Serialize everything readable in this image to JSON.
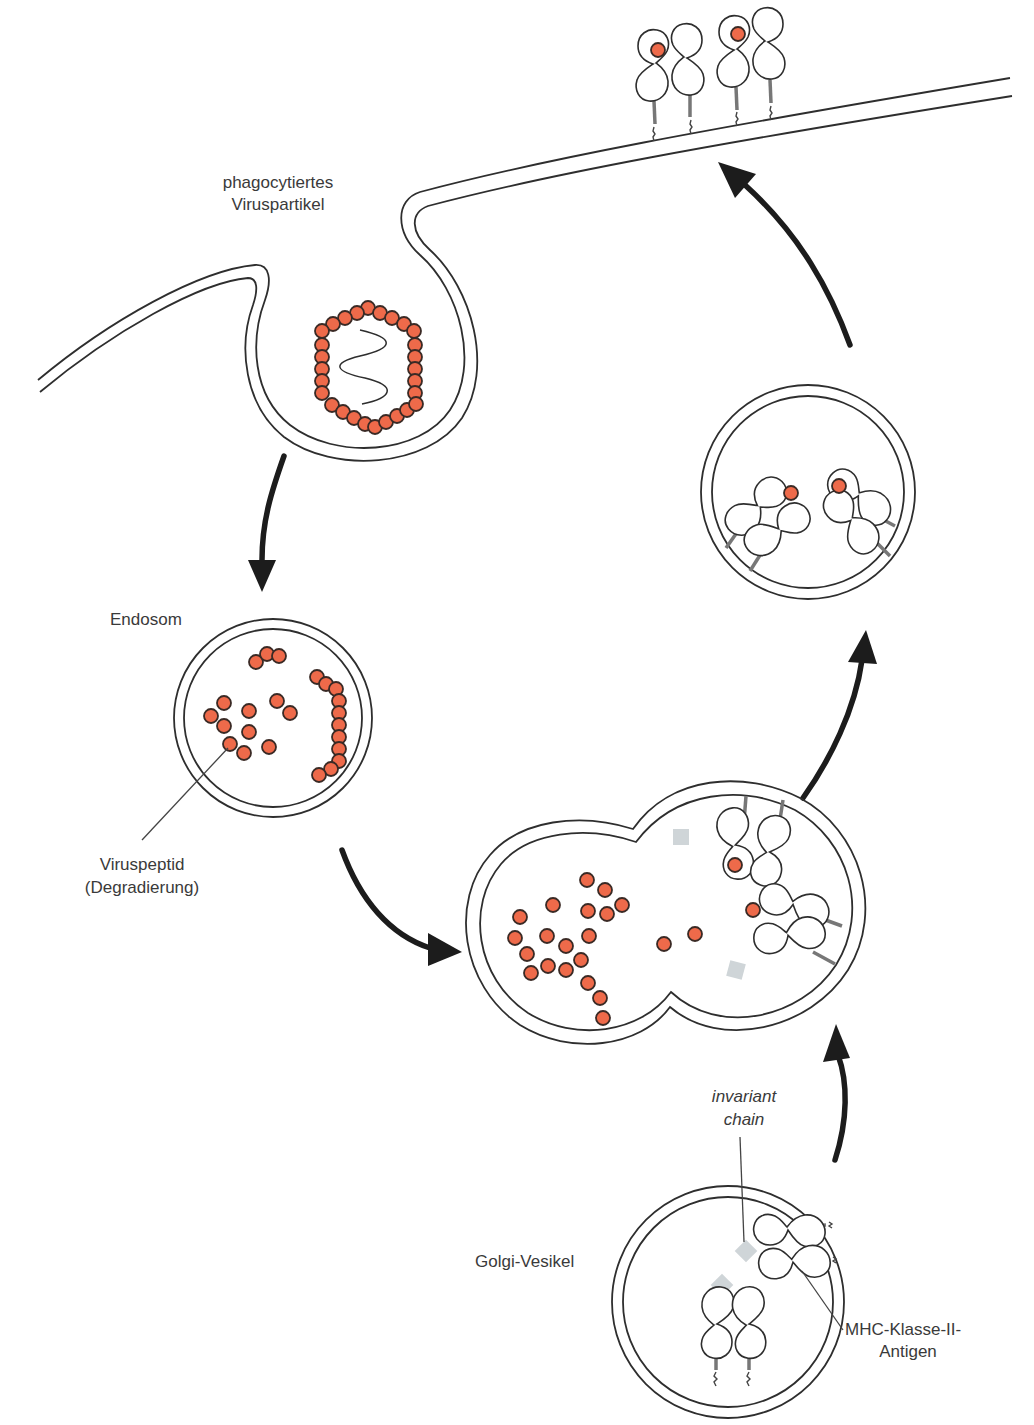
{
  "figure": {
    "colors": {
      "peptide": "#ee6a4a",
      "membrane": "#2e2e2e",
      "arrow": "#1c1c1c",
      "invariant_chain": "#cfd5d8",
      "label_text": "#3a3a3a",
      "background": "#ffffff"
    }
  },
  "labels": {
    "phagocytosed_line1": "phagocytiertes",
    "phagocytosed_line2": "Viruspartikel",
    "endosome": "Endosom",
    "viruspeptide_line1": "Viruspeptid",
    "viruspeptide_line2": "(Degradierung)",
    "invariant_line1": "invariant",
    "invariant_line2": "chain",
    "golgi": "Golgi-Vesikel",
    "mhc_line1": "MHC-Klasse-II-",
    "mhc_line2": "Antigen"
  },
  "stages": [
    {
      "id": "phagocytosis",
      "name": "phagocytiertes Viruspartikel"
    },
    {
      "id": "endosome",
      "name": "Endosom"
    },
    {
      "id": "fusion",
      "name": "Fusion Endosom + Golgi-Vesikel"
    },
    {
      "id": "golgi",
      "name": "Golgi-Vesikel"
    },
    {
      "id": "transport",
      "name": "Transportvesikel mit MHC-Peptid-Komplex"
    },
    {
      "id": "surface",
      "name": "Präsentation an der Zellmembran"
    }
  ]
}
